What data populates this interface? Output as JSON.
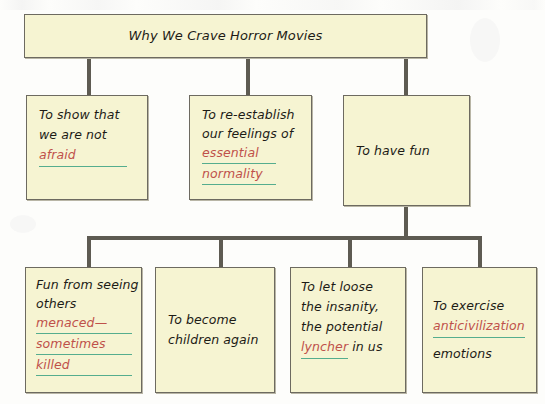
{
  "document": {
    "kind": "concept-map",
    "title": "Why We Crave Horror Movies"
  },
  "colors": {
    "page_background": "#fdfdfb",
    "box_fill": "#f6f4d2",
    "box_border": "#6d6a60",
    "connector": "#5e5b52",
    "text": "#1d1b16",
    "key_term_red": "#bf514a",
    "key_underline_green": "#55ad8e"
  },
  "title_node": {
    "text": "Why We Crave Horror Movies"
  },
  "level2": [
    {
      "id": "to-show-that-we-are-not-afraid",
      "lines": [
        {
          "text": "To show that",
          "style": "plain"
        },
        {
          "text": "we are not",
          "style": "plain"
        },
        {
          "text": "afraid",
          "style": "key"
        }
      ]
    },
    {
      "id": "to-re-establish-our-feelings",
      "lines": [
        {
          "text": "To re-establish",
          "style": "plain"
        },
        {
          "text": "our feelings of",
          "style": "plain"
        },
        {
          "text": "essential",
          "style": "key"
        },
        {
          "text": "normality",
          "style": "key"
        }
      ]
    },
    {
      "id": "to-have-fun",
      "lines": [
        {
          "text": "To have fun",
          "style": "plain"
        }
      ]
    }
  ],
  "level3": [
    {
      "id": "fun-from-seeing-others-menaced",
      "lines": [
        {
          "text": "Fun from seeing",
          "style": "plain"
        },
        {
          "text": "others",
          "style": "plain"
        },
        {
          "text": "menaced—",
          "style": "key"
        },
        {
          "text": "sometimes",
          "style": "key"
        },
        {
          "text": "killed",
          "style": "key"
        }
      ]
    },
    {
      "id": "to-become-children-again",
      "lines": [
        {
          "text": "To become",
          "style": "plain"
        },
        {
          "text": "children again",
          "style": "plain"
        }
      ]
    },
    {
      "id": "to-let-loose-the-insanity",
      "lines": [
        {
          "text": "To let loose",
          "style": "plain"
        },
        {
          "text": "the insanity,",
          "style": "plain"
        },
        {
          "text": "the potential",
          "style": "plain"
        },
        {
          "text": "lyncher",
          "style": "key",
          "suffix": " in us"
        }
      ]
    },
    {
      "id": "to-exercise-anticivilization-emotions",
      "lines": [
        {
          "text": "To exercise",
          "style": "plain"
        },
        {
          "text": "anticivilization",
          "style": "key"
        },
        {
          "text": "emotions",
          "style": "plain"
        }
      ]
    }
  ]
}
